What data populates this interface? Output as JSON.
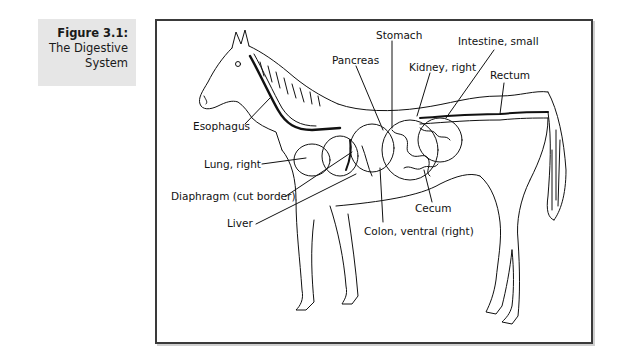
{
  "caption": {
    "number": "Figure 3.1:",
    "title_line1": "The Digestive",
    "title_line2": "System"
  },
  "figure": {
    "labels": {
      "stomach": "Stomach",
      "pancreas": "Pancreas",
      "intestine_small": "Intestine, small",
      "kidney_right": "Kidney, right",
      "rectum": "Rectum",
      "esophagus": "Esophagus",
      "lung_right": "Lung, right",
      "diaphragm": "Diaphragm (cut border)",
      "liver": "Liver",
      "cecum": "Cecum",
      "colon_ventral": "Colon, ventral (right)"
    }
  },
  "colors": {
    "caption_bg": "#e6e6e6",
    "frame_border": "#3a3a3a",
    "ink": "#111111"
  }
}
